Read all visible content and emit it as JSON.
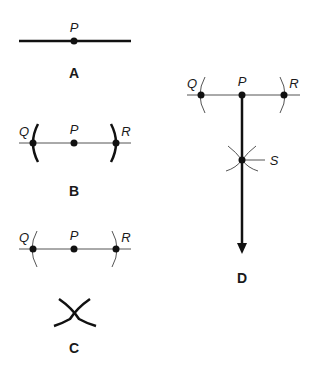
{
  "panels": {
    "A": {
      "caption": "A",
      "point_labels": {
        "P": "P"
      }
    },
    "B": {
      "caption": "B",
      "point_labels": {
        "Q": "Q",
        "P": "P",
        "R": "R"
      }
    },
    "C": {
      "caption": "C",
      "point_labels": {
        "Q": "Q",
        "P": "P",
        "R": "R"
      }
    },
    "D": {
      "caption": "D",
      "point_labels": {
        "Q": "Q",
        "P": "P",
        "R": "R",
        "S": "S"
      }
    }
  },
  "colors": {
    "ink": "#111111",
    "thin_line": "#555555"
  }
}
